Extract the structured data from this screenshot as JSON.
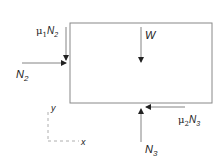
{
  "diagram": {
    "type": "free-body-diagram",
    "body": "rectangular block",
    "forces": {
      "weight": {
        "symbol": "W"
      },
      "normal_left": {
        "symbol": "N",
        "sub": "2"
      },
      "friction_left": {
        "coef": "μ",
        "coef_sub": "1",
        "symbol": "N",
        "sub": "2"
      },
      "normal_bottom": {
        "symbol": "N",
        "sub": "3"
      },
      "friction_bottom": {
        "coef": "μ",
        "coef_sub": "2",
        "symbol": "N",
        "sub": "3"
      }
    },
    "axes": {
      "x": "x",
      "y": "y"
    },
    "colors": {
      "line": "#555555",
      "box": "#777777",
      "text": "#222222"
    }
  }
}
